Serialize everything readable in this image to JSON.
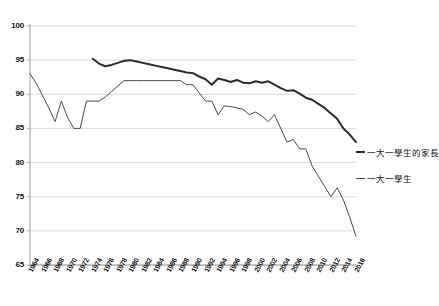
{
  "chart_data": {
    "type": "line",
    "title": "",
    "xlabel": "",
    "ylabel": "",
    "ylim": [
      65,
      100
    ],
    "xlim": [
      1964,
      2016
    ],
    "grid": true,
    "grid_axis": "y",
    "legend_position": "right",
    "yticks": [
      100,
      95,
      90,
      85,
      80,
      75,
      70,
      65
    ],
    "xticks": [
      1964,
      1966,
      1968,
      1970,
      1972,
      1974,
      1976,
      1978,
      1980,
      1982,
      1984,
      1986,
      1988,
      1990,
      1992,
      1994,
      1996,
      1998,
      2000,
      2002,
      2004,
      2006,
      2008,
      2010,
      2012,
      2014,
      2016
    ],
    "series": [
      {
        "name": "一大一學生的家長",
        "color": "#2b2b2b",
        "width": 2,
        "x": [
          1974,
          1975,
          1976,
          1977,
          1978,
          1979,
          1980,
          1981,
          1982,
          1983,
          1984,
          1985,
          1986,
          1987,
          1988,
          1989,
          1990,
          1991,
          1992,
          1993,
          1994,
          1995,
          1996,
          1997,
          1998,
          1999,
          2000,
          2001,
          2002,
          2003,
          2004,
          2005,
          2006,
          2007,
          2008,
          2009,
          2010,
          2011,
          2012,
          2013,
          2014,
          2015,
          2016
        ],
        "y": [
          95.2,
          94.5,
          94.1,
          94.3,
          94.6,
          94.9,
          95.0,
          94.8,
          94.6,
          94.4,
          94.2,
          94.0,
          93.8,
          93.6,
          93.4,
          93.2,
          93.1,
          92.6,
          92.2,
          91.4,
          92.3,
          92.1,
          91.8,
          92.1,
          91.7,
          91.6,
          91.9,
          91.7,
          91.9,
          91.4,
          90.9,
          90.5,
          90.6,
          90.1,
          89.5,
          89.2,
          88.6,
          88.0,
          87.2,
          86.4,
          85.0,
          84.1,
          83.0
        ]
      },
      {
        "name": "一大一學生",
        "color": "#4a4a4a",
        "width": 1,
        "x": [
          1964,
          1965,
          1966,
          1967,
          1968,
          1969,
          1970,
          1971,
          1972,
          1973,
          1974,
          1975,
          1976,
          1977,
          1978,
          1979,
          1980,
          1981,
          1982,
          1983,
          1984,
          1985,
          1986,
          1987,
          1988,
          1989,
          1990,
          1991,
          1992,
          1993,
          1994,
          1995,
          1996,
          1997,
          1998,
          1999,
          2000,
          2001,
          2002,
          2003,
          2004,
          2005,
          2006,
          2007,
          2008,
          2009,
          2010,
          2011,
          2012,
          2013,
          2014,
          2015,
          2016
        ],
        "y": [
          93.0,
          91.6,
          89.8,
          88.0,
          86.0,
          89.0,
          86.6,
          85.0,
          85.0,
          89.0,
          89.0,
          89.0,
          89.6,
          90.4,
          91.2,
          92.0,
          92.0,
          92.0,
          92.0,
          92.0,
          92.0,
          92.0,
          92.0,
          92.0,
          92.0,
          91.4,
          91.4,
          90.2,
          89.0,
          89.0,
          87.0,
          88.3,
          88.2,
          88.0,
          87.8,
          87.0,
          87.4,
          86.8,
          86.0,
          87.0,
          85.0,
          83.0,
          83.4,
          82.0,
          82.0,
          79.5,
          78.0,
          76.5,
          75.0,
          76.3,
          74.5,
          72.0,
          69.2
        ]
      }
    ],
    "legend": [
      {
        "label": "一大一學生的家長",
        "color": "#2b2b2b",
        "thick": true
      },
      {
        "label": "一大一學生",
        "color": "#4a4a4a",
        "thick": false
      }
    ]
  }
}
